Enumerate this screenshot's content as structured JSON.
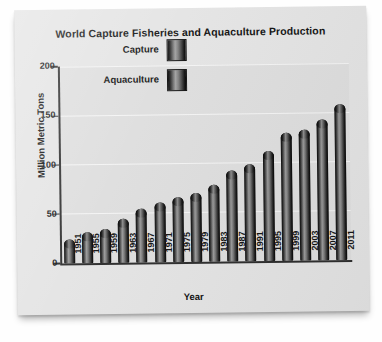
{
  "chart_data": {
    "type": "bar",
    "title": "World Capture Fisheries and Aquaculture Production",
    "xlabel": "Year",
    "ylabel": "Million Metric Tons",
    "ylim": [
      0,
      200
    ],
    "yticks": [
      0,
      50,
      100,
      150,
      200
    ],
    "grid": true,
    "legend_position": "upper-left-inside",
    "categories": [
      "1951",
      "1955",
      "1959",
      "1963",
      "1967",
      "1971",
      "1975",
      "1979",
      "1983",
      "1987",
      "1991",
      "1995",
      "1999",
      "2003",
      "2007",
      "2011"
    ],
    "values": [
      24,
      31,
      35,
      45,
      55,
      61,
      66,
      70,
      78,
      92,
      98,
      112,
      130,
      133,
      143,
      158
    ],
    "series": [
      {
        "name": "Total production",
        "values": [
          24,
          31,
          35,
          45,
          55,
          61,
          66,
          70,
          78,
          92,
          98,
          112,
          130,
          133,
          143,
          158
        ]
      }
    ],
    "legend": [
      {
        "label": "Capture",
        "swatch": "gradient-cylinder-gray"
      },
      {
        "label": "Aquaculture",
        "swatch": "gradient-cylinder-gray"
      }
    ]
  }
}
